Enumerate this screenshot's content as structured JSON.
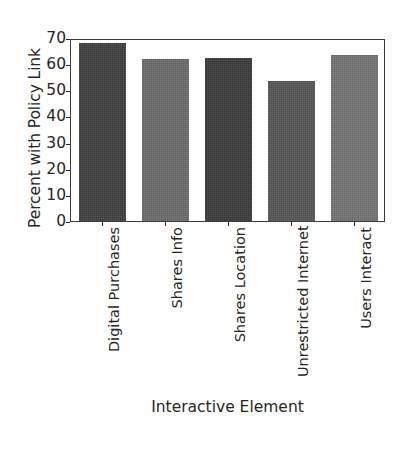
{
  "chart_data": {
    "type": "bar",
    "title": "",
    "xlabel": "Interactive Element",
    "ylabel": "Percent with Policy Link",
    "categories": [
      "Digital Purchases",
      "Shares Info",
      "Shares Location",
      "Unrestricted Internet",
      "Users Interact"
    ],
    "values": [
      68,
      62,
      62.5,
      53.5,
      63.5
    ],
    "ylim": [
      0,
      70
    ],
    "yticks": [
      0,
      10,
      20,
      30,
      40,
      50,
      60,
      70
    ],
    "ytick_labels": [
      "0",
      "10",
      "20",
      "30",
      "40",
      "50",
      "60",
      "70"
    ],
    "grid": false,
    "legend": false,
    "bar_colors": [
      "#3e3e3e",
      "#6a6a6a",
      "#3a3a3a",
      "#555555",
      "#737373"
    ],
    "background": "#ffffff",
    "axis_color": "#3b3b3b"
  }
}
